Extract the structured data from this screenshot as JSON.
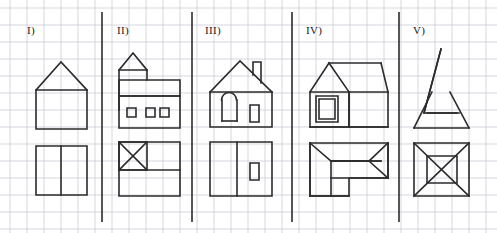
{
  "figure": {
    "title": "",
    "width": 497,
    "height": 233,
    "background_color": "#ffffff",
    "grid": {
      "visible": true,
      "cell_size": 17,
      "origin_x": 10,
      "origin_y": 8,
      "color": "#c9cdd4",
      "line_width": 0.8
    },
    "stroke": {
      "color": "#2b2b2b",
      "width": 1.6,
      "divider_color": "#2b2b2b",
      "divider_width": 1.6
    },
    "dividers": [
      {
        "name": "divider-1",
        "x": 102,
        "y1": 12,
        "y2": 222
      },
      {
        "name": "divider-2",
        "x": 192,
        "y1": 12,
        "y2": 222
      },
      {
        "name": "divider-3",
        "x": 292,
        "y1": 12,
        "y2": 222
      },
      {
        "name": "divider-4",
        "x": 399,
        "y1": 12,
        "y2": 222
      }
    ],
    "panels": [
      {
        "id": "I",
        "label": "I)",
        "label_x": 27,
        "label_y": 33,
        "elevation_name": "house-with-gable-roof",
        "plan_name": "rectangle-split-in-two",
        "shapes": [
          {
            "name": "elevation-body",
            "type": "polyline",
            "closed": true,
            "points": "36,90 36,129 87,129 87,90"
          },
          {
            "name": "elevation-roof",
            "type": "polyline",
            "closed": false,
            "points": "36,90 61,62 87,90"
          },
          {
            "name": "plan-outline",
            "type": "polyline",
            "closed": true,
            "points": "36,146 87,146 87,195 36,195"
          },
          {
            "name": "plan-divider-line",
            "type": "polyline",
            "closed": false,
            "points": "61,146 61,195"
          }
        ]
      },
      {
        "id": "II",
        "label": "II)",
        "label_x": 119,
        "label_y": 33,
        "elevation_name": "house-with-tower-and-three-windows",
        "plan_name": "rectangle-with-crossed-square",
        "shapes": [
          {
            "name": "elevation-tower-body",
            "type": "polyline",
            "closed": false,
            "points": "119,110 119,70 147,70 147,80"
          },
          {
            "name": "elevation-tower-roof",
            "type": "polyline",
            "closed": false,
            "points": "119,70 133,53 147,70"
          },
          {
            "name": "elevation-main-roof-band",
            "type": "polyline",
            "closed": true,
            "points": "119,80 180,80 180,96 119,96"
          },
          {
            "name": "elevation-main-body",
            "type": "polyline",
            "closed": true,
            "points": "119,96 180,96 180,128 119,128"
          },
          {
            "name": "elevation-window-1",
            "type": "polyline",
            "closed": true,
            "points": "127,108 136,108 136,117 127,117"
          },
          {
            "name": "elevation-window-2",
            "type": "polyline",
            "closed": true,
            "points": "146,108 155,108 155,117 146,117"
          },
          {
            "name": "elevation-window-3",
            "type": "polyline",
            "closed": true,
            "points": "160,108 169,108 169,117 160,117"
          },
          {
            "name": "plan-outline",
            "type": "polyline",
            "closed": true,
            "points": "119,142 180,142 180,196 119,196"
          },
          {
            "name": "plan-inner-rect",
            "type": "polyline",
            "closed": true,
            "points": "119,142 147,142 147,170 119,170"
          },
          {
            "name": "plan-horizontal-split",
            "type": "polyline",
            "closed": false,
            "points": "119,170 180,170"
          },
          {
            "name": "plan-diagonal-a",
            "type": "polyline",
            "closed": false,
            "points": "119,142 147,170"
          },
          {
            "name": "plan-diagonal-b",
            "type": "polyline",
            "closed": false,
            "points": "147,142 119,170"
          }
        ]
      },
      {
        "id": "III",
        "label": "III)",
        "label_x": 207,
        "label_y": 33,
        "elevation_name": "house-with-arched-door-and-chimney",
        "plan_name": "rectangle-split-with-small-window",
        "shapes": [
          {
            "name": "elevation-body",
            "type": "polyline",
            "closed": true,
            "points": "210,92 210,127 272,127 272,92"
          },
          {
            "name": "elevation-roof",
            "type": "polyline",
            "closed": false,
            "points": "210,92 240,61 272,92"
          },
          {
            "name": "elevation-chimney",
            "type": "polyline",
            "closed": false,
            "points": "253,75 253,62 261,62 261,83"
          },
          {
            "name": "elevation-arched-door-sides",
            "type": "polyline",
            "closed": false,
            "points": "222,121 222,100"
          },
          {
            "name": "elevation-arched-door-arc",
            "type": "arc",
            "cx": 229,
            "cy": 100,
            "r": 7.5,
            "start": 180,
            "end": 360
          },
          {
            "name": "elevation-arched-door-side2",
            "type": "polyline",
            "closed": false,
            "points": "237,100 237,121"
          },
          {
            "name": "elevation-arched-door-base",
            "type": "polyline",
            "closed": false,
            "points": "222,121 237,121"
          },
          {
            "name": "elevation-window",
            "type": "polyline",
            "closed": true,
            "points": "250,105 259,105 259,122 250,122"
          },
          {
            "name": "plan-outline",
            "type": "polyline",
            "closed": true,
            "points": "210,142 272,142 272,196 210,196"
          },
          {
            "name": "plan-divider-line",
            "type": "polyline",
            "closed": false,
            "points": "237,142 237,196"
          },
          {
            "name": "plan-small-window",
            "type": "polyline",
            "closed": true,
            "points": "250,163 259,163 259,180 250,180"
          }
        ]
      },
      {
        "id": "IV",
        "label": "IV)",
        "label_x": 308,
        "label_y": 33,
        "elevation_name": "perspective-house-with-window",
        "plan_name": "l-shaped-plan-with-roof-lines",
        "shapes": [
          {
            "name": "elevation-front-face",
            "type": "polyline",
            "closed": true,
            "points": "310,92 310,127 349,127 349,92"
          },
          {
            "name": "elevation-front-gable",
            "type": "polyline",
            "closed": false,
            "points": "310,92 329,63 349,92"
          },
          {
            "name": "elevation-ridge-line",
            "type": "polyline",
            "closed": false,
            "points": "329,63 381,63"
          },
          {
            "name": "elevation-right-eave",
            "type": "polyline",
            "closed": false,
            "points": "349,92 388,92"
          },
          {
            "name": "elevation-right-roof-edge",
            "type": "polyline",
            "closed": false,
            "points": "381,63 388,92"
          },
          {
            "name": "elevation-side-face",
            "type": "polyline",
            "closed": false,
            "points": "349,92 349,127 388,127 388,92"
          },
          {
            "name": "elevation-bottom-line",
            "type": "polyline",
            "closed": false,
            "points": "310,127 388,127"
          },
          {
            "name": "elevation-window-outer",
            "type": "polyline",
            "closed": true,
            "points": "316,96 338,96 338,122 316,122"
          },
          {
            "name": "elevation-window-inner",
            "type": "polyline",
            "closed": true,
            "points": "319,99 335,99 335,119 319,119"
          },
          {
            "name": "plan-outline",
            "type": "polyline",
            "closed": true,
            "points": "310,143 388,143 388,178 349,178 349,196 310,196"
          },
          {
            "name": "plan-left-vertical",
            "type": "polyline",
            "closed": false,
            "points": "310,143 310,196"
          },
          {
            "name": "plan-inner-vertical",
            "type": "polyline",
            "closed": false,
            "points": "331,161 331,196"
          },
          {
            "name": "plan-diagonal-top-left",
            "type": "polyline",
            "closed": false,
            "points": "310,143 331,161"
          },
          {
            "name": "plan-ridge-horizontal",
            "type": "polyline",
            "closed": false,
            "points": "331,161 381,161"
          },
          {
            "name": "plan-top-ridge-line",
            "type": "polyline",
            "closed": false,
            "points": "331,161 381,161"
          },
          {
            "name": "plan-diagonal-right-top",
            "type": "polyline",
            "closed": false,
            "points": "388,143 369,161"
          },
          {
            "name": "plan-diagonal-right-bottom",
            "type": "polyline",
            "closed": false,
            "points": "369,161 388,178"
          },
          {
            "name": "plan-ridge-to-right",
            "type": "polyline",
            "closed": false,
            "points": "331,161 369,161"
          },
          {
            "name": "plan-bottom-edge",
            "type": "polyline",
            "closed": false,
            "points": "310,196 349,196"
          },
          {
            "name": "plan-right-vertical",
            "type": "polyline",
            "closed": false,
            "points": "388,143 388,178"
          },
          {
            "name": "plan-mid-horizontal",
            "type": "polyline",
            "closed": false,
            "points": "331,178 388,178"
          }
        ]
      },
      {
        "id": "V",
        "label": "V)",
        "label_x": 415,
        "label_y": 33,
        "elevation_name": "tall-pyramid-tower",
        "plan_name": "square-with-inner-square-and-diagonals",
        "shapes": [
          {
            "name": "elevation-spire",
            "type": "polyline",
            "closed": false,
            "points": "441,49 424,113 459,113"
          },
          {
            "name": "elevation-spire-left",
            "type": "polyline",
            "closed": false,
            "points": "441,49 424,113"
          },
          {
            "name": "elevation-base-left",
            "type": "polyline",
            "closed": false,
            "points": "432,92 414,128"
          },
          {
            "name": "elevation-base-right",
            "type": "polyline",
            "closed": false,
            "points": "450,92 469,128"
          },
          {
            "name": "elevation-mid-line",
            "type": "polyline",
            "closed": false,
            "points": "427,113 457,113"
          },
          {
            "name": "elevation-base-line",
            "type": "polyline",
            "closed": false,
            "points": "414,128 469,128"
          },
          {
            "name": "plan-outline",
            "type": "polyline",
            "closed": true,
            "points": "414,143 469,143 469,196 414,196"
          },
          {
            "name": "plan-inner-square",
            "type": "polyline",
            "closed": true,
            "points": "427,156 457,156 457,183 427,183"
          },
          {
            "name": "plan-diagonal-a",
            "type": "polyline",
            "closed": false,
            "points": "414,143 469,196"
          },
          {
            "name": "plan-diagonal-b",
            "type": "polyline",
            "closed": false,
            "points": "469,143 414,196"
          }
        ]
      }
    ]
  }
}
